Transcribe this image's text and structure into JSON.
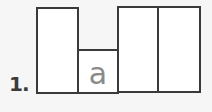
{
  "question": {
    "number_label": "1.",
    "boxes": [
      {
        "letter": ""
      },
      {
        "letter": "a"
      },
      {
        "letter": ""
      },
      {
        "letter": ""
      }
    ]
  },
  "colors": {
    "background": "#f6f6f6",
    "box_border": "#3a3a3a",
    "box_fill": "#ffffff",
    "letter": "#8a8a8a",
    "number": "#3b3b3b"
  }
}
